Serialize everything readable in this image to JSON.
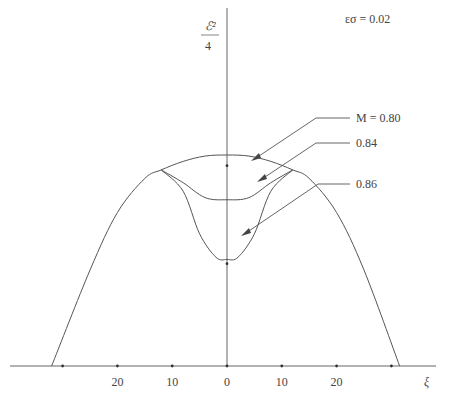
{
  "chart_data": {
    "type": "line",
    "title": "",
    "annotation": "εσ = 0.02",
    "ylabel_numerator": "ℰ²",
    "ylabel_denominator": "4",
    "xlabel": "ξ",
    "x_ticks": [
      -30,
      -20,
      -10,
      0,
      10,
      20,
      30
    ],
    "x_tick_labels": [
      "20",
      "10",
      "0",
      "10",
      "20"
    ],
    "x_tick_label_values": [
      -20,
      -10,
      0,
      10,
      20
    ],
    "xlim": [
      -40,
      38
    ],
    "ylim": [
      0,
      1.0
    ],
    "y_marks": [
      0.94,
      0.48
    ],
    "series": [
      {
        "name": "M = 0.80",
        "label": "M = 0.80",
        "x": [
          -32,
          -25,
          -20,
          -15,
          -12,
          -8,
          -4,
          0,
          4,
          8,
          12,
          15,
          20,
          25,
          31.5
        ],
        "y": [
          0,
          0.45,
          0.72,
          0.88,
          0.92,
          0.96,
          0.985,
          0.99,
          0.985,
          0.96,
          0.92,
          0.88,
          0.72,
          0.45,
          0
        ]
      },
      {
        "name": "0.84",
        "label": "0.84",
        "x": [
          -12,
          -8,
          -4,
          0,
          4,
          8,
          12
        ],
        "y": [
          0.92,
          0.86,
          0.79,
          0.78,
          0.79,
          0.86,
          0.92
        ]
      },
      {
        "name": "0.86",
        "label": "0.86",
        "x": [
          -12,
          -8,
          -5,
          -2,
          0,
          2,
          5,
          8,
          12
        ],
        "y": [
          0.92,
          0.82,
          0.62,
          0.51,
          0.5,
          0.51,
          0.62,
          0.82,
          0.92
        ]
      }
    ],
    "grid": false,
    "legend": "callouts right"
  }
}
